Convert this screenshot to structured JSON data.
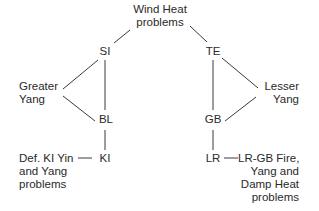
{
  "nodes": {
    "top": {
      "line1": "Wind Heat",
      "line2": "problems"
    },
    "si": "SI",
    "te": "TE",
    "greater_yang": {
      "line1": "Greater",
      "line2": "Yang"
    },
    "lesser_yang": {
      "line1": "Lesser",
      "line2": "Yang"
    },
    "bl": "BL",
    "gb": "GB",
    "ki": "KI",
    "lr": "LR",
    "ki_problems": {
      "line1": "Def. KI Yin",
      "line2": "and Yang",
      "line3": "problems"
    },
    "lr_problems": {
      "line1": "LR-GB Fire,",
      "line2": "Yang and",
      "line3": "Damp Heat",
      "line4": "problems"
    }
  },
  "colors": {
    "line": "#3a3a3a",
    "text": "#2a2a2a",
    "background": "#ffffff"
  }
}
